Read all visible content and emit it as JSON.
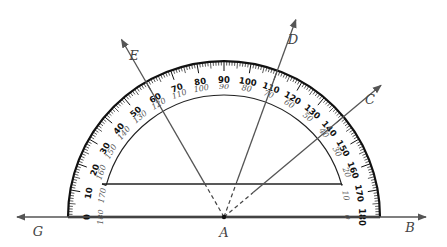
{
  "figure": {
    "type": "protractor-angle-diagram",
    "colors": {
      "ink": "#111111",
      "ray": "#555555",
      "label": "#444444",
      "inner_scale": "#555555"
    }
  },
  "points": {
    "A": {
      "label": "A"
    },
    "B": {
      "label": "B"
    },
    "C": {
      "label": "C"
    },
    "D": {
      "label": "D"
    },
    "E": {
      "label": "E"
    },
    "G": {
      "label": "G"
    }
  },
  "rays": [
    {
      "name": "ray-AB",
      "from": "A",
      "to": "B",
      "angle_deg": 0
    },
    {
      "name": "ray-AC",
      "from": "A",
      "to": "C",
      "angle_deg": 40
    },
    {
      "name": "ray-AD",
      "from": "A",
      "to": "D",
      "angle_deg": 70
    },
    {
      "name": "ray-AE",
      "from": "A",
      "to": "E",
      "angle_deg": 120
    },
    {
      "name": "ray-AG",
      "from": "A",
      "to": "G",
      "angle_deg": 180
    }
  ],
  "protractor": {
    "outer_scale": [
      0,
      10,
      20,
      30,
      40,
      50,
      60,
      70,
      80,
      90,
      100,
      110,
      120,
      130,
      140,
      150,
      160,
      170,
      180
    ],
    "inner_scale": [
      180,
      170,
      160,
      150,
      140,
      130,
      120,
      110,
      100,
      90,
      80,
      70,
      60,
      50,
      40,
      30,
      20,
      10,
      0
    ]
  }
}
